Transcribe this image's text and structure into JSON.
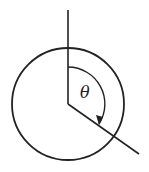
{
  "diagram": {
    "angle_label": "θ",
    "stroke_color": "#222222",
    "background": "#ffffff",
    "circle": {
      "cx": 68,
      "cy": 104,
      "r": 56
    },
    "vertical_ray": {
      "x1": 68,
      "y1": 10,
      "x2": 68,
      "y2": 104
    },
    "rotated_ray": {
      "x1": 68,
      "y1": 104,
      "x2": 139,
      "y2": 154
    },
    "angle_arc": {
      "r": 37,
      "direction": "clockwise",
      "approx_degrees": 125
    }
  }
}
